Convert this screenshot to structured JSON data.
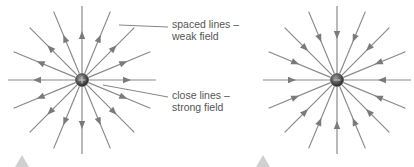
{
  "diagram": {
    "positive_charge": {
      "symbol": "+",
      "field_direction": "outward",
      "center": [
        82,
        80
      ]
    },
    "negative_charge": {
      "symbol": "−",
      "field_direction": "inward",
      "center": [
        337,
        80
      ]
    },
    "annotations": [
      {
        "line1": "spaced lines –",
        "line2": "weak field"
      },
      {
        "line1": "close lines –",
        "line2": "strong field"
      }
    ],
    "colors": {
      "field_line": "#8a8a8a",
      "arrow": "#7a7a7a",
      "charge": "#444444",
      "text": "#555555",
      "marker": "#d0d0d0"
    }
  }
}
